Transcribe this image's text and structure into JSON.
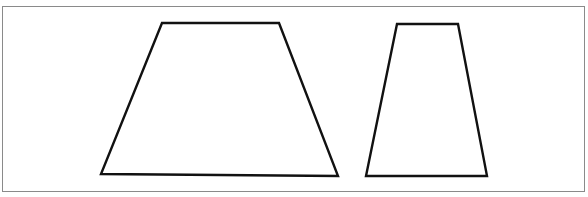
{
  "diagram": {
    "title": "",
    "frame_color": "#8a8a8a",
    "stroke_color": "#111111",
    "shapes": [
      {
        "name": "trapezoid-wide",
        "type": "trapezoid",
        "points": [
          [
            162,
            23
          ],
          [
            279,
            23
          ],
          [
            338,
            176
          ],
          [
            101,
            174
          ]
        ]
      },
      {
        "name": "trapezoid-narrow",
        "type": "trapezoid",
        "points": [
          [
            397,
            24
          ],
          [
            458,
            24
          ],
          [
            487,
            176
          ],
          [
            366,
            176
          ]
        ]
      }
    ]
  }
}
